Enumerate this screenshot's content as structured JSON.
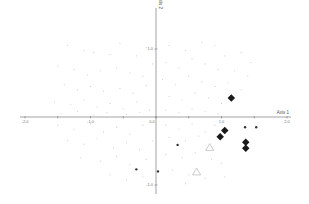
{
  "chart_data": {
    "type": "scatter",
    "title": "",
    "xlabel": "Axis 1",
    "ylabel": "Axis 2",
    "xlim": [
      -2.1,
      2.1
    ],
    "ylim": [
      -1.15,
      1.4
    ],
    "grid": false,
    "legend": null,
    "x_ticks": [
      {
        "value": -2.0,
        "label": "-2.0"
      },
      {
        "value": -1.5,
        "label": ""
      },
      {
        "value": -1.0,
        "label": "-1.0"
      },
      {
        "value": -0.5,
        "label": ""
      },
      {
        "value": 0.0,
        "label": "0.0"
      },
      {
        "value": 0.5,
        "label": ""
      },
      {
        "value": 1.0,
        "label": "1.0"
      },
      {
        "value": 1.5,
        "label": ""
      },
      {
        "value": 2.0,
        "label": "2.0"
      }
    ],
    "y_ticks": [
      {
        "value": 1.0,
        "label": "1.0"
      },
      {
        "value": 0.0,
        "label": "0.0"
      },
      {
        "value": -1.0,
        "label": "-1.0"
      }
    ],
    "series": [
      {
        "name": "highlighted-diamonds",
        "marker": "diamond",
        "color": "#1a1a1a",
        "size": 5,
        "points": [
          {
            "x": 1.15,
            "y": 0.28
          },
          {
            "x": 1.05,
            "y": -0.2
          },
          {
            "x": 0.98,
            "y": -0.29
          },
          {
            "x": 1.37,
            "y": -0.37
          },
          {
            "x": 1.37,
            "y": -0.46
          }
        ]
      },
      {
        "name": "dark-dots",
        "marker": "circle",
        "color": "#333333",
        "size": 1.2,
        "points": [
          {
            "x": 1.36,
            "y": -0.15
          },
          {
            "x": 1.53,
            "y": -0.15
          },
          {
            "x": 0.33,
            "y": -0.41
          },
          {
            "x": -0.3,
            "y": -0.77
          },
          {
            "x": 0.03,
            "y": -0.8
          }
        ]
      },
      {
        "name": "open-triangles",
        "marker": "triangle-open",
        "color": "#aaaaaa",
        "size": 5,
        "points": [
          {
            "x": 0.82,
            "y": -0.45
          },
          {
            "x": 0.62,
            "y": -0.81
          }
        ]
      },
      {
        "name": "background-points",
        "marker": "dot",
        "color": "#cfcfcf",
        "size": 0.6,
        "points": [
          {
            "x": -1.35,
            "y": 1.05
          },
          {
            "x": -1.1,
            "y": 0.98
          },
          {
            "x": -0.95,
            "y": 0.95
          },
          {
            "x": -0.7,
            "y": 0.92
          },
          {
            "x": -0.55,
            "y": 1.08
          },
          {
            "x": -0.3,
            "y": 0.9
          },
          {
            "x": -0.15,
            "y": 1.02
          },
          {
            "x": -1.5,
            "y": 0.75
          },
          {
            "x": -1.25,
            "y": 0.7
          },
          {
            "x": -1.05,
            "y": 0.62
          },
          {
            "x": -0.85,
            "y": 0.68
          },
          {
            "x": -0.6,
            "y": 0.72
          },
          {
            "x": -0.4,
            "y": 0.65
          },
          {
            "x": -0.2,
            "y": 0.6
          },
          {
            "x": -0.05,
            "y": 0.78
          },
          {
            "x": -1.4,
            "y": 0.48
          },
          {
            "x": -1.2,
            "y": 0.4
          },
          {
            "x": -1.0,
            "y": 0.45
          },
          {
            "x": -0.8,
            "y": 0.38
          },
          {
            "x": -0.55,
            "y": 0.42
          },
          {
            "x": -0.35,
            "y": 0.35
          },
          {
            "x": -0.15,
            "y": 0.46
          },
          {
            "x": -1.55,
            "y": 0.22
          },
          {
            "x": -1.3,
            "y": 0.18
          },
          {
            "x": -1.1,
            "y": 0.25
          },
          {
            "x": -0.9,
            "y": 0.15
          },
          {
            "x": -0.7,
            "y": 0.2
          },
          {
            "x": -0.5,
            "y": 0.12
          },
          {
            "x": -0.3,
            "y": 0.22
          },
          {
            "x": -0.1,
            "y": 0.1
          },
          {
            "x": -1.45,
            "y": 0.05
          },
          {
            "x": -1.2,
            "y": 0.08
          },
          {
            "x": -0.95,
            "y": 0.03
          },
          {
            "x": -0.75,
            "y": 0.06
          },
          {
            "x": -0.45,
            "y": 0.04
          },
          {
            "x": -0.25,
            "y": 0.07
          },
          {
            "x": -1.5,
            "y": -0.12
          },
          {
            "x": -1.25,
            "y": -0.18
          },
          {
            "x": -1.0,
            "y": -0.1
          },
          {
            "x": -0.8,
            "y": -0.22
          },
          {
            "x": -0.6,
            "y": -0.15
          },
          {
            "x": -0.4,
            "y": -0.25
          },
          {
            "x": -0.2,
            "y": -0.12
          },
          {
            "x": -1.35,
            "y": -0.35
          },
          {
            "x": -1.1,
            "y": -0.4
          },
          {
            "x": -0.9,
            "y": -0.32
          },
          {
            "x": -0.65,
            "y": -0.45
          },
          {
            "x": -0.45,
            "y": -0.38
          },
          {
            "x": -0.25,
            "y": -0.48
          },
          {
            "x": -0.05,
            "y": -0.35
          },
          {
            "x": -1.15,
            "y": -0.6
          },
          {
            "x": -0.85,
            "y": -0.65
          },
          {
            "x": -0.6,
            "y": -0.58
          },
          {
            "x": -0.4,
            "y": -0.7
          },
          {
            "x": -0.15,
            "y": -0.62
          },
          {
            "x": -0.7,
            "y": -0.85
          },
          {
            "x": -0.45,
            "y": -0.92
          },
          {
            "x": -0.2,
            "y": -0.88
          },
          {
            "x": 0.2,
            "y": 1.05
          },
          {
            "x": 0.45,
            "y": 0.98
          },
          {
            "x": 0.7,
            "y": 1.1
          },
          {
            "x": 0.9,
            "y": 1.05
          },
          {
            "x": 1.05,
            "y": 0.9
          },
          {
            "x": 1.3,
            "y": 0.95
          },
          {
            "x": 1.45,
            "y": 0.8
          },
          {
            "x": 0.15,
            "y": 0.8
          },
          {
            "x": 0.35,
            "y": 0.72
          },
          {
            "x": 0.55,
            "y": 0.85
          },
          {
            "x": 0.75,
            "y": 0.78
          },
          {
            "x": 0.95,
            "y": 0.7
          },
          {
            "x": 1.2,
            "y": 0.68
          },
          {
            "x": 1.4,
            "y": 0.6
          },
          {
            "x": 0.1,
            "y": 0.55
          },
          {
            "x": 0.3,
            "y": 0.48
          },
          {
            "x": 0.5,
            "y": 0.6
          },
          {
            "x": 0.7,
            "y": 0.52
          },
          {
            "x": 0.9,
            "y": 0.45
          },
          {
            "x": 1.1,
            "y": 0.5
          },
          {
            "x": 1.3,
            "y": 0.4
          },
          {
            "x": 0.2,
            "y": 0.3
          },
          {
            "x": 0.4,
            "y": 0.25
          },
          {
            "x": 0.6,
            "y": 0.35
          },
          {
            "x": 0.8,
            "y": 0.28
          },
          {
            "x": 1.0,
            "y": 0.2
          },
          {
            "x": 0.15,
            "y": 0.1
          },
          {
            "x": 0.35,
            "y": 0.06
          },
          {
            "x": 0.55,
            "y": 0.12
          },
          {
            "x": 0.75,
            "y": 0.08
          },
          {
            "x": 0.95,
            "y": 0.05
          },
          {
            "x": 0.15,
            "y": -0.12
          },
          {
            "x": 0.35,
            "y": -0.18
          },
          {
            "x": 0.55,
            "y": -0.1
          },
          {
            "x": 0.75,
            "y": -0.22
          },
          {
            "x": 0.9,
            "y": -0.12
          },
          {
            "x": 0.2,
            "y": -0.3
          },
          {
            "x": 0.45,
            "y": -0.35
          },
          {
            "x": 0.65,
            "y": -0.28
          },
          {
            "x": 0.15,
            "y": -0.55
          },
          {
            "x": 0.4,
            "y": -0.6
          },
          {
            "x": 0.6,
            "y": -0.52
          },
          {
            "x": 0.85,
            "y": -0.62
          },
          {
            "x": 1.0,
            "y": -0.68
          },
          {
            "x": 0.25,
            "y": -0.78
          },
          {
            "x": 0.5,
            "y": -0.85
          },
          {
            "x": 0.75,
            "y": -0.9
          },
          {
            "x": 1.05,
            "y": -0.88
          },
          {
            "x": 0.45,
            "y": -0.98
          }
        ]
      }
    ]
  },
  "axes": {
    "x_title": "Axis 1",
    "y_title": "Axis 2"
  }
}
